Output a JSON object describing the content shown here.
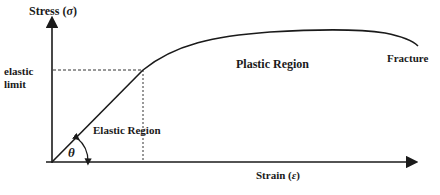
{
  "diagram": {
    "y_axis": {
      "label": "Stress",
      "symbol": "σ"
    },
    "x_axis": {
      "label": "Strain",
      "symbol": "ε"
    },
    "y_marker": {
      "line1": "elastic",
      "line2": "limit"
    },
    "regions": {
      "elastic": "Elastic Region",
      "plastic": "Plastic Region"
    },
    "endpoint": "Fracture",
    "angle_symbol": "θ",
    "colors": {
      "line": "#1a1a1a",
      "background": "#ffffff"
    }
  }
}
